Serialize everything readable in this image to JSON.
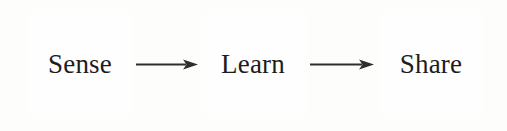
{
  "diagram": {
    "type": "linear-flow",
    "title": "Sense Learn Share",
    "background_color": "#fdfdfc",
    "stroke_color": "#4a4a4a",
    "text_color": "#1d1d1d",
    "arrow_color": "#2e2e2e",
    "nodes": [
      {
        "id": "sense",
        "label": "Sense",
        "order": 1
      },
      {
        "id": "learn",
        "label": "Learn",
        "order": 2
      },
      {
        "id": "share",
        "label": "Share",
        "order": 3
      }
    ],
    "connectors": [
      {
        "id": "sense-learn",
        "from": "sense",
        "to": "learn",
        "style": "solid-arrow",
        "direction": "right"
      },
      {
        "id": "learn-share",
        "from": "learn",
        "to": "share",
        "style": "solid-arrow",
        "direction": "right"
      }
    ]
  }
}
